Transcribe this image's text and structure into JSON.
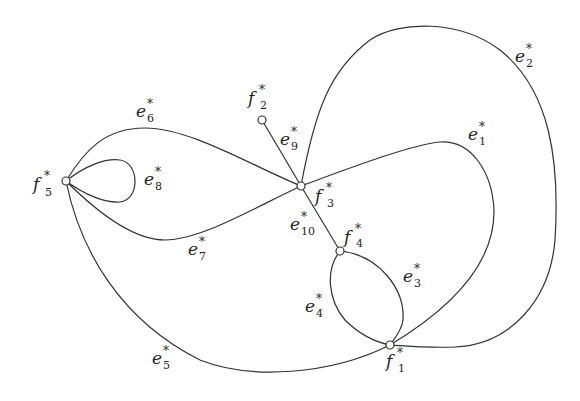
{
  "diagram": {
    "type": "dual graph",
    "nodes": [
      {
        "id": "f1",
        "base": "f",
        "sub": "1",
        "sup": "*"
      },
      {
        "id": "f2",
        "base": "f",
        "sub": "2",
        "sup": "*"
      },
      {
        "id": "f3",
        "base": "f",
        "sub": "3",
        "sup": "*"
      },
      {
        "id": "f4",
        "base": "f",
        "sub": "4",
        "sup": "*"
      },
      {
        "id": "f5",
        "base": "f",
        "sub": "5",
        "sup": "*"
      }
    ],
    "edges": [
      {
        "id": "e1",
        "base": "e",
        "sub": "1",
        "sup": "*",
        "from": "f3",
        "to": "f1"
      },
      {
        "id": "e2",
        "base": "e",
        "sub": "2",
        "sup": "*",
        "from": "f3",
        "to": "f1"
      },
      {
        "id": "e3",
        "base": "e",
        "sub": "3",
        "sup": "*",
        "from": "f4",
        "to": "f1"
      },
      {
        "id": "e4",
        "base": "e",
        "sub": "4",
        "sup": "*",
        "from": "f4",
        "to": "f1"
      },
      {
        "id": "e5",
        "base": "e",
        "sub": "5",
        "sup": "*",
        "from": "f5",
        "to": "f1"
      },
      {
        "id": "e6",
        "base": "e",
        "sub": "6",
        "sup": "*",
        "from": "f5",
        "to": "f3"
      },
      {
        "id": "e7",
        "base": "e",
        "sub": "7",
        "sup": "*",
        "from": "f5",
        "to": "f3"
      },
      {
        "id": "e8",
        "base": "e",
        "sub": "8",
        "sup": "*",
        "from": "f5",
        "to": "f5"
      },
      {
        "id": "e9",
        "base": "e",
        "sub": "9",
        "sup": "*",
        "from": "f2",
        "to": "f3"
      },
      {
        "id": "e10",
        "base": "e",
        "sub": "10",
        "sup": "*",
        "from": "f3",
        "to": "f4"
      }
    ]
  }
}
